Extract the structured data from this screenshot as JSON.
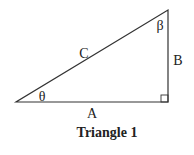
{
  "diagram": {
    "caption": "Triangle 1",
    "sides": {
      "adjacent": "A",
      "opposite": "B",
      "hypotenuse": "C"
    },
    "angles": {
      "bottom_left": "θ",
      "top": "β"
    },
    "right_angle_marker": true,
    "line_color": "#333333"
  }
}
